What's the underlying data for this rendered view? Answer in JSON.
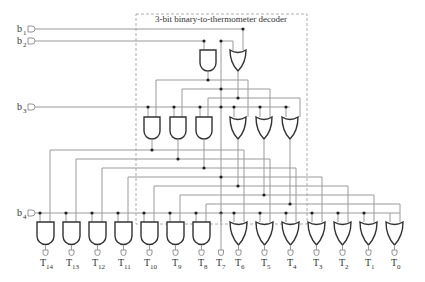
{
  "title": "3-bit binary-to-thermometer decoder",
  "inputs": [
    {
      "name": "b",
      "sub": "1",
      "y": 29
    },
    {
      "name": "b",
      "sub": "2",
      "y": 41
    },
    {
      "name": "b",
      "sub": "3",
      "y": 107
    },
    {
      "name": "b",
      "sub": "4",
      "y": 213
    }
  ],
  "decoder_gates": {
    "stage1": [
      {
        "type": "AND",
        "x": 200
      },
      {
        "type": "OR",
        "x": 230
      }
    ],
    "stage2": [
      {
        "type": "AND",
        "x": 144
      },
      {
        "type": "AND",
        "x": 170
      },
      {
        "type": "AND",
        "x": 196
      },
      {
        "type": "OR",
        "x": 230
      },
      {
        "type": "OR",
        "x": 256
      },
      {
        "type": "OR",
        "x": 282
      }
    ]
  },
  "outputs": [
    {
      "name": "T",
      "sub": "14",
      "type": "AND"
    },
    {
      "name": "T",
      "sub": "13",
      "type": "AND"
    },
    {
      "name": "T",
      "sub": "12",
      "type": "AND"
    },
    {
      "name": "T",
      "sub": "11",
      "type": "AND"
    },
    {
      "name": "T",
      "sub": "10",
      "type": "AND"
    },
    {
      "name": "T",
      "sub": "9",
      "type": "AND"
    },
    {
      "name": "T",
      "sub": "8",
      "type": "AND"
    },
    {
      "name": "T",
      "sub": "7",
      "type": "WIRE"
    },
    {
      "name": "T",
      "sub": "6",
      "type": "OR"
    },
    {
      "name": "T",
      "sub": "5",
      "type": "OR"
    },
    {
      "name": "T",
      "sub": "4",
      "type": "OR"
    },
    {
      "name": "T",
      "sub": "3",
      "type": "OR"
    },
    {
      "name": "T",
      "sub": "2",
      "type": "OR"
    },
    {
      "name": "T",
      "sub": "1",
      "type": "OR"
    },
    {
      "name": "T",
      "sub": "0",
      "type": "OR"
    }
  ],
  "colors": {
    "wire": "#9a9a9a",
    "gate": "#333333",
    "junction": "#222222",
    "background": "#ffffff"
  }
}
